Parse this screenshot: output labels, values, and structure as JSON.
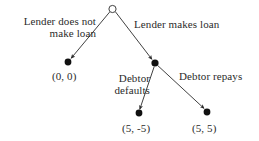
{
  "diagram": {
    "type": "extensive-form-game-tree",
    "background_color": "#ffffff",
    "ink_color": "#2b2b2b",
    "nodes": [
      {
        "id": "root",
        "name": "root-node",
        "style": "hollow-circle",
        "x": 112.5,
        "y": 9,
        "r": 3.6
      },
      {
        "id": "no-loan-terminal",
        "name": "terminal-node-no-loan",
        "style": "filled-circle",
        "x": 68,
        "y": 62,
        "r": 3.4
      },
      {
        "id": "debtor-decision",
        "name": "debtor-decision-node",
        "style": "filled-circle",
        "x": 155,
        "y": 63,
        "r": 3.6
      },
      {
        "id": "default-terminal",
        "name": "terminal-node-default",
        "style": "filled-circle",
        "x": 139,
        "y": 113,
        "r": 3.4
      },
      {
        "id": "repay-terminal",
        "name": "terminal-node-repay",
        "style": "filled-circle",
        "x": 207,
        "y": 112,
        "r": 3.4
      }
    ],
    "edges": [
      {
        "id": "edge-no-loan",
        "name": "edge-lender-does-not-make-loan",
        "from": "root",
        "to": "no-loan-terminal",
        "x1": 109.6,
        "y1": 12.1,
        "x2": 71.2,
        "y2": 58.2,
        "arrow": true
      },
      {
        "id": "edge-makes-loan",
        "name": "edge-lender-makes-loan",
        "from": "root",
        "to": "debtor-decision",
        "x1": 115.6,
        "y1": 12.0,
        "x2": 151.9,
        "y2": 59.3,
        "arrow": true
      },
      {
        "id": "edge-defaults",
        "name": "edge-debtor-defaults",
        "from": "debtor-decision",
        "to": "default-terminal",
        "x1": 154.2,
        "y1": 66.6,
        "x2": 139.8,
        "y2": 109.2,
        "arrow": true
      },
      {
        "id": "edge-repays",
        "name": "edge-debtor-repays",
        "from": "debtor-decision",
        "to": "repay-terminal",
        "x1": 158.0,
        "y1": 65.8,
        "x2": 204.0,
        "y2": 108.4,
        "arrow": true
      }
    ],
    "labels": {
      "lender_no_loan": "Lender does not\nmake loan",
      "lender_makes_loan": "Lender makes loan",
      "debtor_defaults": "Debtor\ndefaults",
      "debtor_repays": "Debtor repays"
    },
    "payoffs": {
      "no_loan": "(0, 0)",
      "default": "(5, -5)",
      "repay": "(5, 5)"
    }
  }
}
